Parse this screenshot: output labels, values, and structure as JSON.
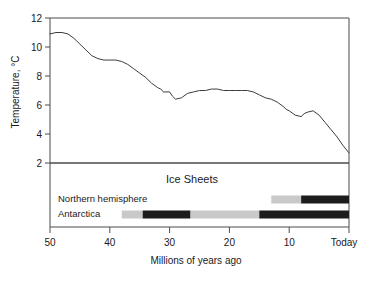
{
  "figure": {
    "background_color": "#ffffff",
    "line_color": "#3c3c3c",
    "gray_color": "#c9c9c9",
    "black_color": "#1c1c1c"
  },
  "axes": {
    "y_title": "Temperature, °C",
    "x_title": "Millions of years ago",
    "y_ticks": [
      "12",
      "10",
      "8",
      "6",
      "4",
      "2"
    ],
    "x_ticks": [
      "50",
      "40",
      "30",
      "20",
      "10",
      "Today"
    ]
  },
  "panel": {
    "title": "Ice Sheets",
    "rows": [
      {
        "label": "Northern hemisphere"
      },
      {
        "label": "Antarctica"
      }
    ]
  },
  "chart_data": {
    "type": "line",
    "title": "",
    "subtitle": "",
    "xlabel": "Millions of years ago",
    "ylabel": "Temperature, °C",
    "xlim": [
      50,
      0
    ],
    "ylim": [
      2,
      12
    ],
    "x_tick_values": [
      50,
      40,
      30,
      20,
      10,
      0
    ],
    "x_tick_labels": [
      "50",
      "40",
      "30",
      "20",
      "10",
      "Today"
    ],
    "y_tick_values": [
      12,
      10,
      8,
      6,
      4,
      2
    ],
    "y_tick_labels": [
      "12",
      "10",
      "8",
      "6",
      "4",
      "2"
    ],
    "grid": false,
    "legend": null,
    "x_axis_direction": "reversed",
    "series": [
      {
        "name": "Global temperature",
        "color": "#3c3c3c",
        "x": [
          50.0,
          49.0,
          48.0,
          47.0,
          46.0,
          45.0,
          44.0,
          43.0,
          42.0,
          41.0,
          40.0,
          39.0,
          38.0,
          37.0,
          36.0,
          35.0,
          34.0,
          33.0,
          32.0,
          31.5,
          31.0,
          30.0,
          29.5,
          29.0,
          28.0,
          27.0,
          26.0,
          25.0,
          24.0,
          23.0,
          22.0,
          21.0,
          20.0,
          19.0,
          18.0,
          17.0,
          16.0,
          15.0,
          14.0,
          13.0,
          12.0,
          11.0,
          10.5,
          10.0,
          9.0,
          8.0,
          7.5,
          7.0,
          6.0,
          5.0,
          4.0,
          3.0,
          2.0,
          1.0,
          0.0
        ],
        "y": [
          10.9,
          11.0,
          11.0,
          10.9,
          10.6,
          10.2,
          9.8,
          9.4,
          9.2,
          9.1,
          9.1,
          9.1,
          9.0,
          8.8,
          8.5,
          8.2,
          7.9,
          7.5,
          7.2,
          7.1,
          6.9,
          6.9,
          6.6,
          6.4,
          6.5,
          6.8,
          6.9,
          7.0,
          7.0,
          7.1,
          7.1,
          7.0,
          7.0,
          7.0,
          7.0,
          7.0,
          6.9,
          6.7,
          6.5,
          6.4,
          6.2,
          5.9,
          5.7,
          5.6,
          5.3,
          5.2,
          5.4,
          5.5,
          5.6,
          5.3,
          4.8,
          4.3,
          3.8,
          3.2,
          2.7
        ]
      }
    ],
    "annotations": [
      {
        "type": "panel",
        "title": "Ice Sheets",
        "tracks": [
          {
            "label": "Northern hemisphere",
            "segments": [
              {
                "from": 13.0,
                "to": 8.0,
                "state": "partial",
                "color": "#c9c9c9"
              },
              {
                "from": 8.0,
                "to": 0.0,
                "state": "full",
                "color": "#1c1c1c"
              }
            ]
          },
          {
            "label": "Antarctica",
            "segments": [
              {
                "from": 38.0,
                "to": 34.5,
                "state": "partial",
                "color": "#c9c9c9"
              },
              {
                "from": 34.5,
                "to": 26.5,
                "state": "full",
                "color": "#1c1c1c"
              },
              {
                "from": 26.5,
                "to": 15.0,
                "state": "partial",
                "color": "#c9c9c9"
              },
              {
                "from": 15.0,
                "to": 0.0,
                "state": "full",
                "color": "#1c1c1c"
              }
            ]
          }
        ]
      }
    ]
  }
}
